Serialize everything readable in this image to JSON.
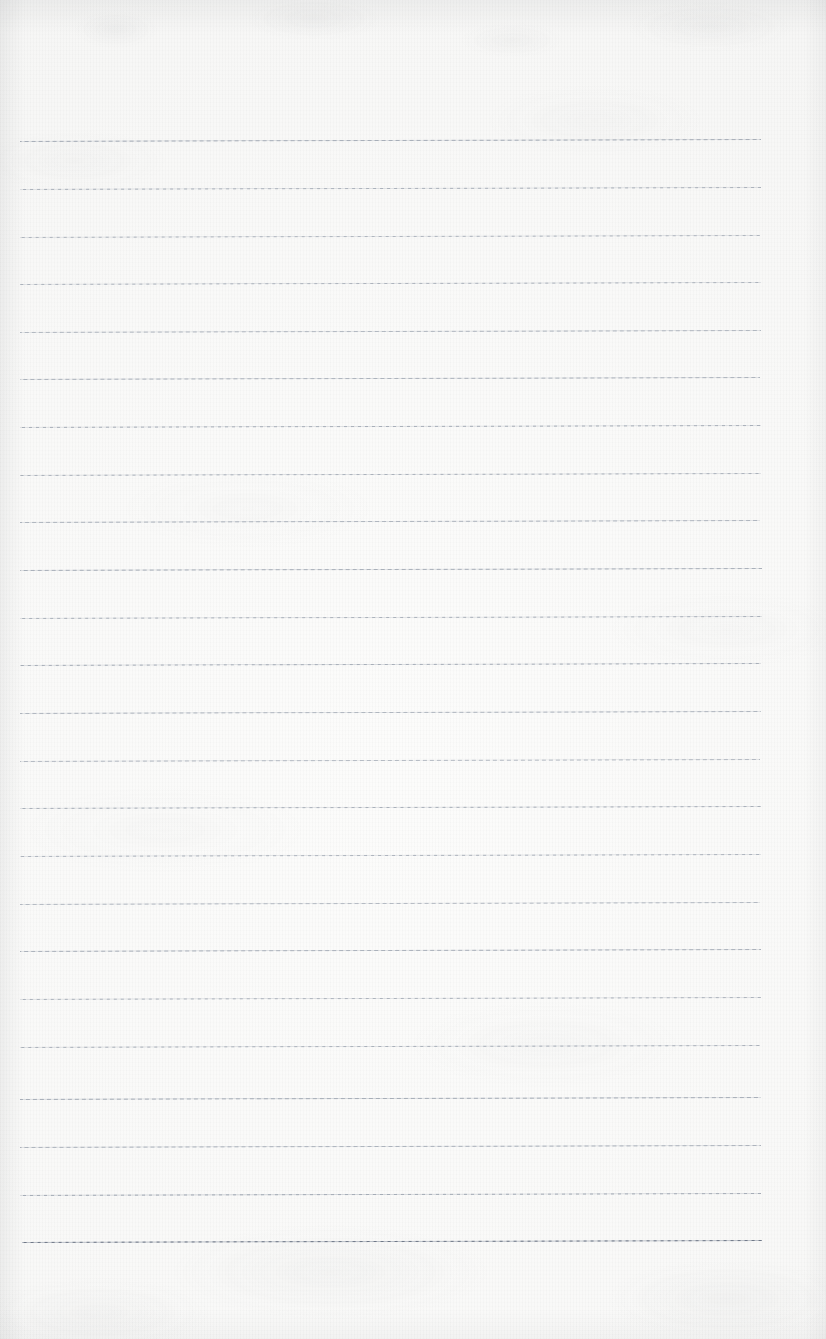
{
  "document": {
    "kind": "scanned-lined-paper",
    "title": "Blank ruled notebook page",
    "content_text": "",
    "page_width": 826,
    "page_height": 1339,
    "orientation": "portrait",
    "has_handwriting": false,
    "has_printed_text": false,
    "has_margin_line": false,
    "has_holes": false
  },
  "paper": {
    "background_color": "#f9f9f8",
    "highlight_color": "#fcfcfb",
    "edge_shadow_color": "#8c8f94",
    "texture": "fine woven scan grain with faint blotches near top and bottom edges"
  },
  "rules": {
    "count": 24,
    "color": "#8d96a4",
    "dark_color": "#6b7484",
    "thickness_px": 1,
    "style": "fine dashed-appearance scanned ruling",
    "left_x": 20,
    "right_x": 762,
    "first_y": 142,
    "spacing_y": 47.6,
    "slope_deg": -0.16,
    "lines": [
      {
        "index": 1,
        "y": 142,
        "left_x": 20,
        "right_x": 761,
        "opacity": 0.78,
        "weight": 1.0
      },
      {
        "index": 2,
        "y": 190,
        "left_x": 20,
        "right_x": 761,
        "opacity": 0.74,
        "weight": 1.0
      },
      {
        "index": 3,
        "y": 238,
        "left_x": 20,
        "right_x": 760,
        "opacity": 0.7,
        "weight": 1.0
      },
      {
        "index": 4,
        "y": 285,
        "left_x": 20,
        "right_x": 761,
        "opacity": 0.72,
        "weight": 1.0
      },
      {
        "index": 5,
        "y": 333,
        "left_x": 20,
        "right_x": 761,
        "opacity": 0.68,
        "weight": 1.0
      },
      {
        "index": 6,
        "y": 380,
        "left_x": 20,
        "right_x": 760,
        "opacity": 0.72,
        "weight": 1.0
      },
      {
        "index": 7,
        "y": 428,
        "left_x": 20,
        "right_x": 761,
        "opacity": 0.76,
        "weight": 1.0
      },
      {
        "index": 8,
        "y": 476,
        "left_x": 20,
        "right_x": 761,
        "opacity": 0.74,
        "weight": 1.0
      },
      {
        "index": 9,
        "y": 523,
        "left_x": 20,
        "right_x": 760,
        "opacity": 0.7,
        "weight": 1.0
      },
      {
        "index": 10,
        "y": 571,
        "left_x": 20,
        "right_x": 762,
        "opacity": 0.76,
        "weight": 1.0
      },
      {
        "index": 11,
        "y": 619,
        "left_x": 20,
        "right_x": 762,
        "opacity": 0.74,
        "weight": 1.0
      },
      {
        "index": 12,
        "y": 666,
        "left_x": 20,
        "right_x": 761,
        "opacity": 0.78,
        "weight": 1.05
      },
      {
        "index": 13,
        "y": 714,
        "left_x": 20,
        "right_x": 761,
        "opacity": 0.7,
        "weight": 1.0
      },
      {
        "index": 14,
        "y": 762,
        "left_x": 20,
        "right_x": 760,
        "opacity": 0.66,
        "weight": 0.95
      },
      {
        "index": 15,
        "y": 809,
        "left_x": 20,
        "right_x": 761,
        "opacity": 0.76,
        "weight": 1.0
      },
      {
        "index": 16,
        "y": 857,
        "left_x": 20,
        "right_x": 761,
        "opacity": 0.72,
        "weight": 1.0
      },
      {
        "index": 17,
        "y": 905,
        "left_x": 20,
        "right_x": 760,
        "opacity": 0.66,
        "weight": 0.95
      },
      {
        "index": 18,
        "y": 952,
        "left_x": 20,
        "right_x": 761,
        "opacity": 0.74,
        "weight": 1.0
      },
      {
        "index": 19,
        "y": 1000,
        "left_x": 20,
        "right_x": 761,
        "opacity": 0.72,
        "weight": 1.0
      },
      {
        "index": 20,
        "y": 1048,
        "left_x": 20,
        "right_x": 760,
        "opacity": 0.74,
        "weight": 1.0
      },
      {
        "index": 21,
        "y": 1100,
        "left_x": 20,
        "right_x": 761,
        "opacity": 0.78,
        "weight": 1.05
      },
      {
        "index": 22,
        "y": 1148,
        "left_x": 20,
        "right_x": 761,
        "opacity": 0.72,
        "weight": 1.0
      },
      {
        "index": 23,
        "y": 1196,
        "left_x": 20,
        "right_x": 761,
        "opacity": 0.8,
        "weight": 1.1
      },
      {
        "index": 24,
        "y": 1243,
        "left_x": 22,
        "right_x": 762,
        "opacity": 1.0,
        "weight": 1.35
      }
    ]
  }
}
